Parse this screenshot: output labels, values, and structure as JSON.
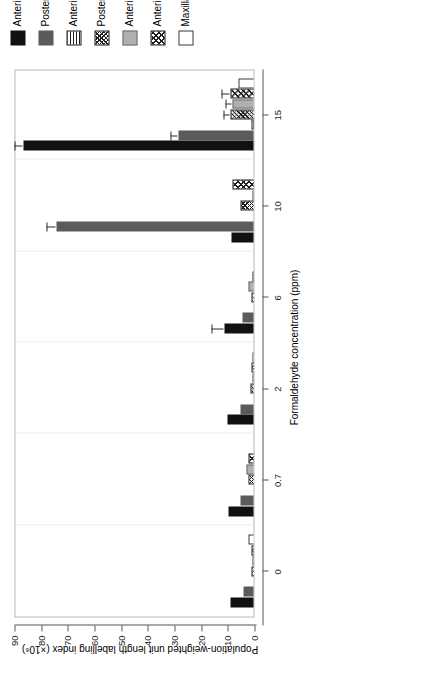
{
  "chart_data": {
    "type": "bar",
    "orientation": "vertical",
    "title": "",
    "xlabel": "Formaldehyde concentration (ppm)",
    "ylabel": "Population-weighted unit length labelling index (×10⁶)",
    "categories": [
      "0",
      "0.7",
      "2",
      "6",
      "10",
      "15"
    ],
    "ylim": [
      0,
      90
    ],
    "yticks": [
      0,
      10,
      20,
      30,
      40,
      50,
      60,
      70,
      80,
      90
    ],
    "ytick_labels": [
      "0",
      "10",
      "20",
      "30",
      "40",
      "50",
      "60",
      "70",
      "80",
      "90"
    ],
    "grid": true,
    "legend_position": "right",
    "series": [
      {
        "name": "Anterior lateral meatus",
        "pattern": "p-black",
        "values": [
          9.5,
          10.0,
          10.5,
          11.5,
          9.0,
          87.0
        ],
        "errors": [
          0.0,
          0.0,
          0.0,
          4.5,
          0.0,
          3.0
        ]
      },
      {
        "name": "Posterior lateral meatus",
        "pattern": "p-darkgray",
        "values": [
          4.5,
          5.5,
          5.5,
          5.0,
          74.5,
          29.0
        ],
        "errors": [
          0.0,
          0.0,
          0.0,
          0.0,
          3.5,
          2.5
        ]
      },
      {
        "name": "Anterior mid-spetum",
        "pattern": "p-hstripe",
        "values": [
          0.3,
          0.5,
          0.5,
          0.5,
          0.5,
          1.5
        ],
        "errors": [
          0.0,
          0.0,
          0.0,
          0.0,
          0.0,
          0.0
        ]
      },
      {
        "name": "Posterior mid-septum",
        "pattern": "p-xhatch",
        "values": [
          1.5,
          2.5,
          2.0,
          1.5,
          5.5,
          9.5
        ],
        "errors": [
          0.0,
          0.0,
          0.0,
          0.0,
          0.0,
          2.0
        ]
      },
      {
        "name": "Anterior dorsal septum",
        "pattern": "p-lightgray",
        "values": [
          1.0,
          3.5,
          1.0,
          2.5,
          1.0,
          8.5
        ],
        "errors": [
          0.0,
          0.0,
          0.0,
          0.0,
          0.0,
          2.5
        ]
      },
      {
        "name": "Anterior medial maxilloturbinate",
        "pattern": "p-dhatch",
        "values": [
          1.5,
          2.5,
          1.5,
          1.0,
          8.5,
          9.5
        ],
        "errors": [
          0.0,
          0.0,
          0.0,
          0.0,
          0.0,
          3.0
        ]
      },
      {
        "name": "Maxillary sinus",
        "pattern": "p-white",
        "values": [
          2.5,
          0.2,
          1.0,
          0.2,
          0.2,
          6.5
        ],
        "errors": [
          0.0,
          0.0,
          0.0,
          0.0,
          0.0,
          0.0
        ]
      }
    ]
  },
  "axis": {
    "x_title": "Formaldehyde concentration (ppm)",
    "y_title": "Population-weighted unit length labelling index (×10⁶)"
  },
  "legend": {
    "items": [
      {
        "label": "Anterior lateral meatus",
        "pattern": "p-black"
      },
      {
        "label": "Posterior lateral meatus",
        "pattern": "p-darkgray"
      },
      {
        "label": "Anterior mid-spetum",
        "pattern": "p-hstripe"
      },
      {
        "label": "Posterior mid-septum",
        "pattern": "p-xhatch"
      },
      {
        "label": "Anterior dorsal septum",
        "pattern": "p-lightgray"
      },
      {
        "label": "Anterior medial maxilloturbinate",
        "pattern": "p-dhatch"
      },
      {
        "label": "Maxillary sinus",
        "pattern": "p-white"
      }
    ]
  }
}
